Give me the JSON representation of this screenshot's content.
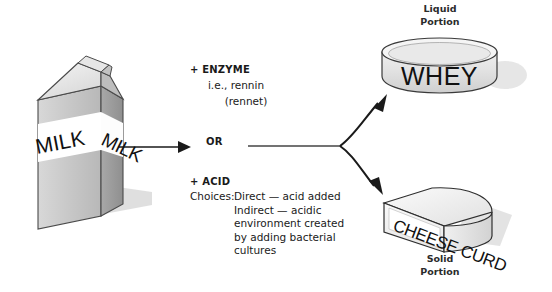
{
  "diagram": {
    "title_flow": "milk-to-cheese-curd-and-whey",
    "source_label": "MILK",
    "source_label_side": "MILK",
    "connector_or": "OR",
    "enzyme": {
      "heading": "+ ENZYME",
      "line2": "i.e., rennin",
      "line3": "(rennet)"
    },
    "acid": {
      "heading": "+ ACID",
      "choices_label": "Choices:",
      "rows": [
        {
          "label": "Choices:",
          "text": "Direct — acid added"
        },
        {
          "label": "",
          "text": "Indirect — acidic"
        },
        {
          "label": "",
          "text": "environment created"
        },
        {
          "label": "",
          "text": "by adding bacterial"
        },
        {
          "label": "",
          "text": "cultures"
        }
      ]
    },
    "outputs": {
      "liquid": {
        "caption_line1": "Liquid",
        "caption_line2": "Portion",
        "vessel_label": "WHEY"
      },
      "solid": {
        "caption_line1": "Solid",
        "caption_line2": "Portion",
        "block_label": "CHEESE CURD"
      }
    },
    "colors": {
      "ink": "#1a1a1a",
      "caption": "#2b2b2b",
      "stroke": "#333333",
      "carton_front": "#c9c9c9",
      "carton_side": "#9e9e9e",
      "carton_top": "#e8e8e8",
      "band": "#ffffff",
      "vessel_fill": "#e3e3e3",
      "vessel_top": "#f2f2f2",
      "cheese_fill": "#ededed",
      "shadow": "#d6d6d6",
      "background": "#ffffff"
    }
  }
}
